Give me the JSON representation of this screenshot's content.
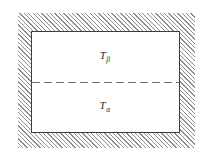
{
  "figure": {
    "canvas_width": 208,
    "canvas_height": 156,
    "background_color": "#ffffff"
  },
  "hatched_region": {
    "name": "hatched-surroundings",
    "hatch_angle_deg": 45,
    "hatch_color": "#8d8d8d",
    "hatch_spacing_px": 3,
    "bounds": {
      "x": 18,
      "y": 13,
      "width": 177,
      "height": 135
    }
  },
  "body_rectangle": {
    "name": "two-phase-body",
    "fill_color": "#ffffff",
    "border_color": "#3d3d3d",
    "border_width_px": 1,
    "bounds": {
      "x": 31,
      "y": 31,
      "width": 149,
      "height": 102
    }
  },
  "interface": {
    "name": "phase-interface",
    "style": "dashed",
    "color": "#6e6e6e",
    "dash_length_px": 8,
    "gap_length_px": 4,
    "y": 82
  },
  "labels": {
    "upper": {
      "symbol": "T",
      "subscript": "β",
      "full_text": "Tβ",
      "region": "upper-half",
      "x": 105,
      "y": 57,
      "color": "#2b2b2b"
    },
    "lower": {
      "symbol": "T",
      "subscript": "α",
      "full_text": "Tα",
      "region": "lower-half",
      "x": 105,
      "y": 107,
      "color": "#2b2b2b"
    }
  }
}
